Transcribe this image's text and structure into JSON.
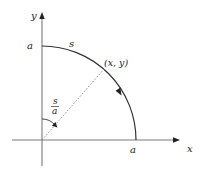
{
  "diagram": {
    "type": "quarter-circle arc parametrization",
    "axes": {
      "x_label": "x",
      "y_label": "y"
    },
    "labels": {
      "y_intercept": "a",
      "x_intercept": "a",
      "arc_length": "s",
      "point": "(x, y)",
      "angle_numerator": "s",
      "angle_denominator": "a"
    },
    "colors": {
      "axis": "#7a7a7a",
      "arc": "#333333",
      "dashed": "#888888",
      "text": "#222222"
    }
  }
}
